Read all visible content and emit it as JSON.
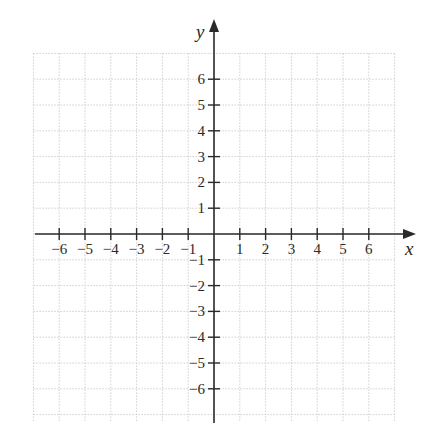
{
  "chart_data": {
    "type": "scatter",
    "title": "",
    "xlabel": "x",
    "ylabel": "y",
    "xlim": [
      -6,
      6
    ],
    "ylim": [
      -6,
      6
    ],
    "grid": true,
    "x_ticks": [
      -6,
      -5,
      -4,
      -3,
      -2,
      -1,
      1,
      2,
      3,
      4,
      5,
      6
    ],
    "y_ticks": [
      -6,
      -5,
      -4,
      -3,
      -2,
      -1,
      1,
      2,
      3,
      4,
      5,
      6
    ],
    "x_tick_labels": [
      "−6",
      "−5",
      "−4",
      "−3",
      "−2",
      "−1",
      "1",
      "2",
      "3",
      "4",
      "5",
      "6"
    ],
    "y_tick_labels": [
      "−6",
      "−5",
      "−4",
      "−3",
      "−2",
      "−1",
      "1",
      "2",
      "3",
      "4",
      "5",
      "6"
    ],
    "series": [],
    "legend": null
  },
  "axes": {
    "x_label": "x",
    "y_label": "y"
  },
  "colors": {
    "axis": "#2a2a2a",
    "grid": "#cfcfcf",
    "background": "#ffffff"
  }
}
